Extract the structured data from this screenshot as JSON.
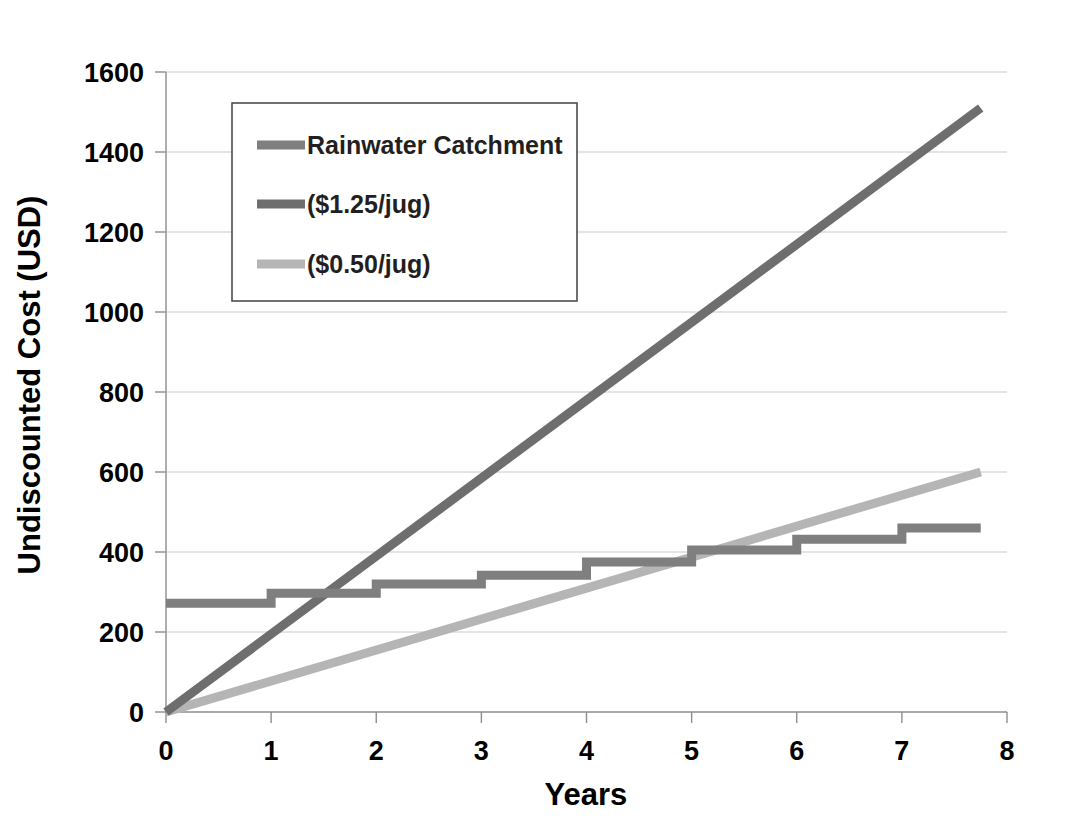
{
  "chart_data": {
    "type": "line",
    "title": "",
    "xlabel": "Years",
    "ylabel": "Undiscounted Cost (USD)",
    "xlim": [
      0,
      8
    ],
    "ylim": [
      0,
      1600
    ],
    "xticks": [
      "0",
      "1",
      "2",
      "3",
      "4",
      "5",
      "6",
      "7",
      "8"
    ],
    "yticks": [
      "0",
      "200",
      "400",
      "600",
      "800",
      "1000",
      "1200",
      "1400",
      "1600"
    ],
    "grid": "horizontal",
    "legend_position": "upper-left-inside",
    "series": [
      {
        "name": "Rainwater Catchment",
        "color": "#7f7f7f",
        "width": 9,
        "shape": "step",
        "x": [
          0,
          1,
          1,
          2,
          2,
          3,
          3,
          4,
          4,
          5,
          5,
          6,
          6,
          7,
          7,
          7.75
        ],
        "y": [
          272,
          272,
          297,
          297,
          320,
          320,
          342,
          342,
          375,
          375,
          405,
          405,
          432,
          432,
          460,
          460
        ]
      },
      {
        "name": "($1.25/jug)",
        "color": "#6e6e6e",
        "width": 9,
        "shape": "linear",
        "x": [
          0,
          7.75
        ],
        "y": [
          0,
          1510
        ]
      },
      {
        "name": "($0.50/jug)",
        "color": "#b5b5b5",
        "width": 9,
        "shape": "linear",
        "x": [
          0,
          7.75
        ],
        "y": [
          0,
          600
        ]
      }
    ],
    "legend_entries": [
      {
        "label": "Rainwater Catchment",
        "color": "#7f7f7f"
      },
      {
        "label": "($1.25/jug)",
        "color": "#6e6e6e"
      },
      {
        "label": "($0.50/jug)",
        "color": "#b5b5b5"
      }
    ]
  }
}
